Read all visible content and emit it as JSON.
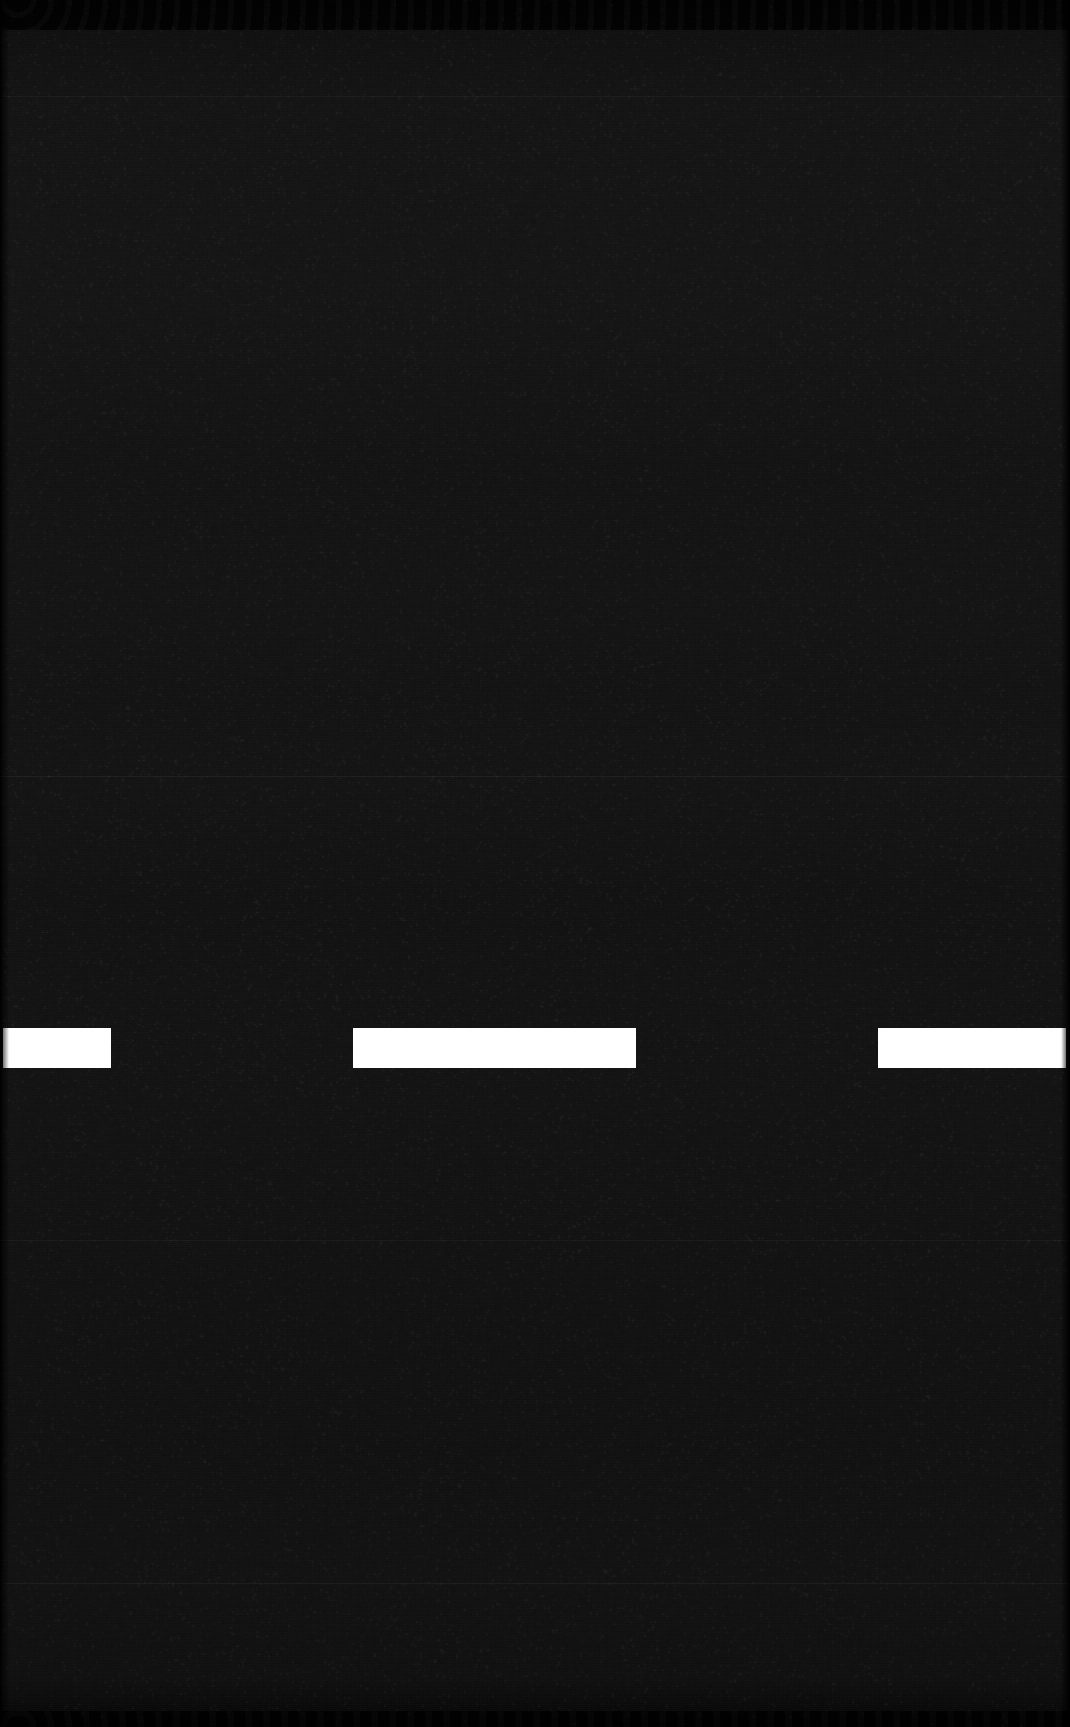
{
  "frame": {
    "width": 1070,
    "height": 1727,
    "title": "Dark scan frame with white dash marks",
    "background_color": "#121212",
    "darkest_band_color": "#080808",
    "mark_color": "#ffffff"
  },
  "texture": {
    "description": "near-black noisy scan field with fine horizontal scanline and vertical weave grain",
    "grain_opacity": "0.5"
  },
  "bands": [
    {
      "name": "top-dark-band",
      "y": 0,
      "height": 28,
      "color": "#090909"
    },
    {
      "name": "upper-mid-band",
      "y": 28,
      "height": 68,
      "color": "#101010"
    },
    {
      "name": "light-plateau",
      "y": 96,
      "height": 204,
      "color": "#151515"
    },
    {
      "name": "mid-field",
      "y": 300,
      "height": 476,
      "color": "#131313"
    },
    {
      "name": "lower-field",
      "y": 776,
      "height": 804,
      "color": "#121212"
    },
    {
      "name": "bottom-field",
      "y": 1580,
      "height": 134,
      "color": "#111111"
    },
    {
      "name": "bottom-dark-band",
      "y": 1714,
      "height": 13,
      "color": "#070707"
    }
  ],
  "hairlines": [
    {
      "name": "hairline-upper",
      "y": 776,
      "opacity": "0.055"
    },
    {
      "name": "hairline-lower",
      "y": 1583,
      "opacity": "0.050"
    },
    {
      "name": "hairline-faint-a",
      "y": 96,
      "opacity": "0.030"
    },
    {
      "name": "hairline-faint-b",
      "y": 1240,
      "opacity": "0.028"
    }
  ],
  "marks": {
    "label": "dash-marks",
    "row_y": 1028,
    "row_height": 40,
    "color": "#ffffff",
    "count": 3,
    "items": [
      {
        "name": "dash-mark-1",
        "x": 3,
        "width": 108,
        "clipped": "left"
      },
      {
        "name": "dash-mark-2",
        "x": 353,
        "width": 283,
        "clipped": "none"
      },
      {
        "name": "dash-mark-3",
        "x": 878,
        "width": 188,
        "clipped": "right"
      }
    ]
  }
}
